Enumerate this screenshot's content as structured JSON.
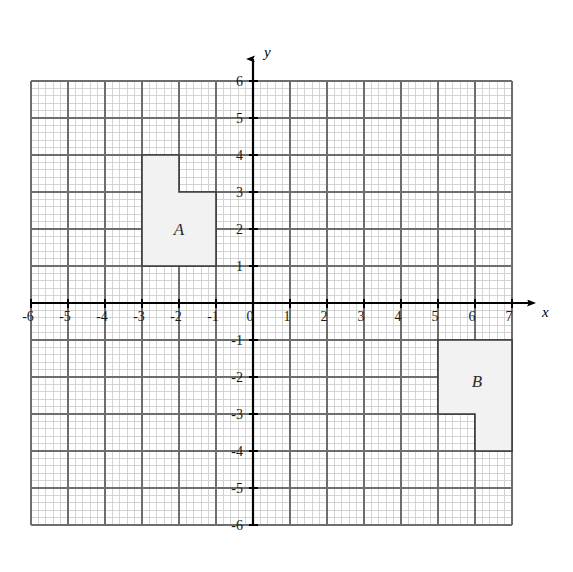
{
  "figure": {
    "title": "",
    "background_color": "#ffffff"
  },
  "chart_data": {
    "type": "scatter",
    "title": "",
    "xlabel": "x",
    "ylabel": "y",
    "xlim": [
      -6,
      7
    ],
    "ylim": [
      -6,
      6
    ],
    "grid": true,
    "minor_grid": true,
    "minor_subdivisions": 5,
    "legend_position": "none",
    "x_ticks": [
      -6,
      -5,
      -4,
      -3,
      -2,
      -1,
      0,
      1,
      2,
      3,
      4,
      5,
      6,
      7
    ],
    "x_tick_labels": [
      "-6",
      "-5",
      "-4",
      "-3",
      "-2",
      "-1",
      "0",
      "1",
      "2",
      "3",
      "4",
      "5",
      "6",
      "7"
    ],
    "y_ticks": [
      -6,
      -5,
      -4,
      -3,
      -2,
      -1,
      1,
      2,
      3,
      4,
      5,
      6
    ],
    "y_tick_labels": [
      "-6",
      "-5",
      "-4",
      "-3",
      "-2",
      "-1",
      "1",
      "2",
      "3",
      "4",
      "5",
      "6"
    ],
    "origin_label": "0",
    "annotations": [
      {
        "name": "shape-a",
        "label": "A",
        "label_position": [
          -2.0,
          2.0
        ],
        "fill": "#f2f2f2",
        "stroke": "#3a3a3a",
        "vertices": [
          [
            -3,
            4
          ],
          [
            -2,
            4
          ],
          [
            -2,
            3
          ],
          [
            -1,
            3
          ],
          [
            -1,
            1
          ],
          [
            -3,
            1
          ]
        ]
      },
      {
        "name": "shape-b",
        "label": "B",
        "label_position": [
          6.05,
          -2.1
        ],
        "fill": "#f2f2f2",
        "stroke": "#3a3a3a",
        "vertices": [
          [
            5,
            -1
          ],
          [
            7,
            -1
          ],
          [
            7,
            -4
          ],
          [
            6,
            -4
          ],
          [
            6,
            -3
          ],
          [
            5,
            -3
          ]
        ]
      }
    ],
    "axis_arrows": {
      "x_positive": true,
      "y_positive": true
    },
    "colors": {
      "axis": "#000000",
      "major_grid": "#6e6e6e",
      "minor_grid": "#c9c9c9",
      "shape_fill": "#f2f2f2",
      "shape_stroke": "#3a3a3a",
      "tick_text": "#1a1a1a"
    }
  }
}
